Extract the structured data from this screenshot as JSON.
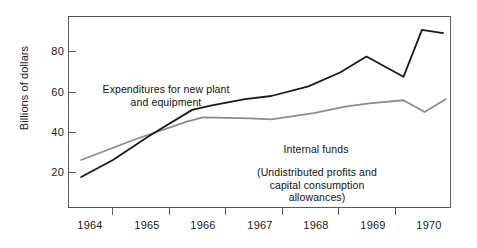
{
  "chart_data": {
    "type": "line",
    "title": "",
    "subtitle": "",
    "xlabel": "",
    "ylabel": "Billions of dollars",
    "ylim": [
      0,
      90
    ],
    "xlim": [
      1963.75,
      1971.0
    ],
    "yticks": [
      20,
      40,
      60,
      80
    ],
    "ytick_labels": [
      "20",
      "40",
      "60",
      "80"
    ],
    "xtick_positions": [
      1964.5,
      1965.5,
      1966.5,
      1967.5,
      1968.5,
      1969.5,
      1970.5
    ],
    "xtick_labels": [
      "1964",
      "1965",
      "1966",
      "1967",
      "1968",
      "1969",
      "1970"
    ],
    "grid": false,
    "legend": "annotations-inline",
    "series": [
      {
        "name": "Expenditures for new plant and equipment",
        "color": "#1a1a1a",
        "width": 1.8,
        "x": [
          1964.0,
          1964.6,
          1965.3,
          1966.1,
          1966.45,
          1967.1,
          1967.6,
          1968.3,
          1968.9,
          1969.4,
          1970.1,
          1970.45,
          1970.85
        ],
        "values": [
          14.5,
          22.5,
          34.0,
          46.0,
          48.0,
          51.0,
          52.5,
          57.0,
          63.5,
          71.0,
          61.5,
          83.5,
          82.0
        ]
      },
      {
        "name": "Internal funds",
        "color": "#8a8d90",
        "width": 1.8,
        "x": [
          1964.0,
          1965.0,
          1966.0,
          1966.3,
          1967.2,
          1967.6,
          1968.4,
          1969.0,
          1969.45,
          1970.1,
          1970.5,
          1970.9
        ],
        "values": [
          22.5,
          32.0,
          40.5,
          42.5,
          42.0,
          41.5,
          44.5,
          47.5,
          49.0,
          50.5,
          45.0,
          51.0
        ]
      }
    ],
    "annotations": [
      {
        "name": "expenditures-label",
        "text": "Expenditures for new plant\nand equipment"
      },
      {
        "name": "internal-funds-label",
        "text": "Internal funds"
      },
      {
        "name": "internal-funds-sublabel",
        "text": "(Undistributed profits and\ncapital consumption\nallowances)"
      }
    ]
  },
  "axes": {
    "y_title": "Billions of dollars",
    "y_ticks": [
      {
        "label": "20",
        "value": 20
      },
      {
        "label": "40",
        "value": 40
      },
      {
        "label": "60",
        "value": 60
      },
      {
        "label": "80",
        "value": 80
      }
    ],
    "x_ticks": [
      {
        "label": "1964"
      },
      {
        "label": "1965"
      },
      {
        "label": "1966"
      },
      {
        "label": "1967"
      },
      {
        "label": "1968"
      },
      {
        "label": "1969"
      },
      {
        "label": "1970"
      }
    ]
  },
  "colors": {
    "series_expenditures": "#1a1a1a",
    "series_internal_funds": "#8a8d90",
    "frame": "#55585c",
    "text": "#111111",
    "background": "#ffffff"
  }
}
